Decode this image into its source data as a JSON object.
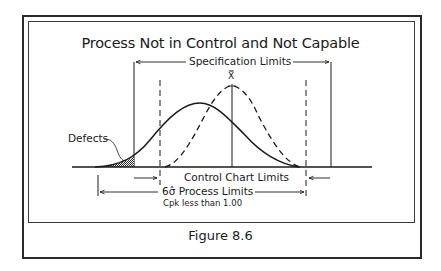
{
  "figure": {
    "title": "Process Not in Control and Not Capable",
    "caption": "Figure 8.6"
  },
  "labels": {
    "specification_limits": "Specification Limits",
    "xbar_symbol": "X̿",
    "defects": "Defects",
    "control_chart_limits": "Control Chart Limits",
    "process_limits": "6σ̂ Process Limits",
    "cpk_note": "Cpk less than 1.00"
  },
  "curves": {
    "solid": "process distribution (shifted left, wider)",
    "dashed": "target distribution (centered on X̿, narrower)"
  },
  "colors": {
    "line": "#1a1a1a",
    "background": "#ffffff"
  }
}
